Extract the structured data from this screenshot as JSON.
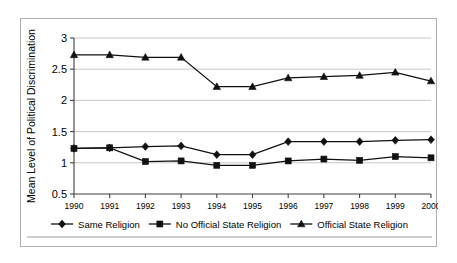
{
  "chart_data": {
    "type": "line",
    "title": "",
    "xlabel": "",
    "ylabel": "Mean Level of Political Discrimination",
    "categories": [
      "1990",
      "1991",
      "1992",
      "1993",
      "1994",
      "1995",
      "1996",
      "1997",
      "1998",
      "1999",
      "2000"
    ],
    "x": [
      1990,
      1991,
      1992,
      1993,
      1994,
      1995,
      1996,
      1997,
      1998,
      1999,
      2000
    ],
    "ylim": [
      0.5,
      3
    ],
    "yticks": [
      "0.5",
      "1",
      "1.5",
      "2",
      "2.5",
      "3"
    ],
    "ytick_values": [
      0.5,
      1,
      1.5,
      2,
      2.5,
      3
    ],
    "grid": true,
    "legend_position": "bottom",
    "series": [
      {
        "name": "Same Religion",
        "marker": "diamond",
        "values": [
          1.23,
          1.24,
          1.26,
          1.27,
          1.13,
          1.13,
          1.34,
          1.34,
          1.34,
          1.36,
          1.37
        ]
      },
      {
        "name": "No Official State Religion",
        "marker": "square",
        "values": [
          1.23,
          1.24,
          1.02,
          1.03,
          0.96,
          0.96,
          1.03,
          1.06,
          1.04,
          1.1,
          1.08
        ]
      },
      {
        "name": "Official State Religion",
        "marker": "triangle",
        "values": [
          2.73,
          2.73,
          2.69,
          2.69,
          2.22,
          2.22,
          2.36,
          2.38,
          2.4,
          2.45,
          2.31
        ]
      }
    ]
  },
  "colors": {
    "series_line": "#111111",
    "gridline": "#c8c8c8",
    "axis": "#404040",
    "frame_border": "#b0b0b0",
    "background": "#ffffff"
  }
}
